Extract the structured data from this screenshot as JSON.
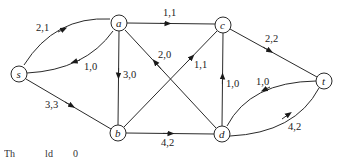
{
  "diagram": {
    "type": "flow-network",
    "nodes": [
      {
        "id": "s",
        "label": "s",
        "x": 19,
        "y": 74
      },
      {
        "id": "a",
        "label": "a",
        "x": 119,
        "y": 23
      },
      {
        "id": "c",
        "label": "c",
        "x": 223,
        "y": 25
      },
      {
        "id": "b",
        "label": "b",
        "x": 118,
        "y": 133
      },
      {
        "id": "d",
        "label": "d",
        "x": 222,
        "y": 134
      },
      {
        "id": "t",
        "label": "t",
        "x": 324,
        "y": 81
      }
    ],
    "edges": [
      {
        "from": "s",
        "to": "a",
        "label": "2,1"
      },
      {
        "from": "a",
        "to": "s",
        "label": "1,0"
      },
      {
        "from": "a",
        "to": "c",
        "label": "1,1"
      },
      {
        "from": "a",
        "to": "b",
        "label": "3,0"
      },
      {
        "from": "d",
        "to": "a",
        "label": "2,0"
      },
      {
        "from": "b",
        "to": "c",
        "label": "1,1"
      },
      {
        "from": "d",
        "to": "c",
        "label": "1,0"
      },
      {
        "from": "c",
        "to": "t",
        "label": "2,2"
      },
      {
        "from": "t",
        "to": "d",
        "label": "1,0"
      },
      {
        "from": "d",
        "to": "t",
        "label": "4,2"
      },
      {
        "from": "s",
        "to": "b",
        "label": "3,3"
      },
      {
        "from": "b",
        "to": "d",
        "label": "4,2"
      }
    ]
  },
  "caption": {
    "text": "Th   ld  0"
  }
}
